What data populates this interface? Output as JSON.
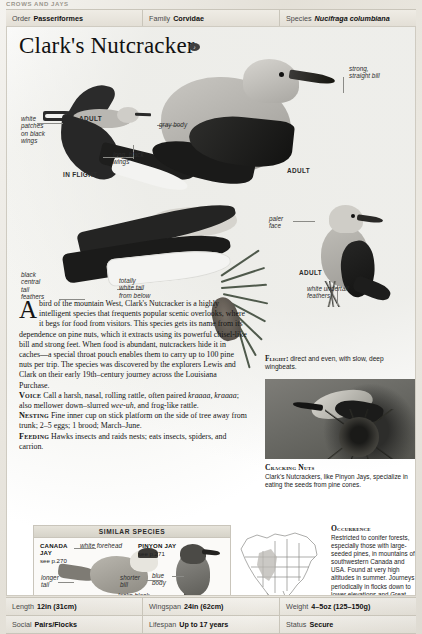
{
  "running_head": "CROWS AND JAYS",
  "taxonomy": [
    {
      "key": "Order",
      "value": "Passeriformes",
      "italic": false
    },
    {
      "key": "Family",
      "value": "Corvidae",
      "italic": false
    },
    {
      "key": "Species",
      "value": "Nucifraga columbiana",
      "italic": true
    }
  ],
  "title": "Clark's Nutcracker",
  "title_badge": "♪",
  "labels": {
    "white_patches": "white\npatches\non black\nwings",
    "in_flight": "IN FLIGHT",
    "adult_flight": "ADULT",
    "long_black_wings": "long, black\nwings",
    "gray_body": "gray body",
    "strong_straight_bill": "strong,\nstraight bill",
    "adult_main": "ADULT",
    "paler_face": "paler\nface",
    "adult_right": "ADULT",
    "white_undertail": "white undertail\nfeathers",
    "black_central_tail": "black\ncentral\ntail\nfeathers",
    "totally_white_tail": "totally\nwhite tail\nfrom below"
  },
  "body": {
    "dropcap": "A",
    "intro": " bird of the mountain West, Clark's Nutcracker is a highly intelligent species that frequents popular scenic overlooks, where it begs for food from visitors. This species gets its name from its dependence on pine nuts, which it extracts using its powerful chisel-like bill and strong feet. When food is abundant, nutcrackers hide it in caches—a special throat pouch enables them to carry up to 100 pine nuts per trip. The species was discovered by the explorers Lewis and Clark on their early 19th–century journey across the Louisiana Purchase.",
    "voice_label": "Voice",
    "voice_text_1": " Call a harsh, nasal, rolling rattle, often paired ",
    "voice_call_1": "kraaaa, kraaaa",
    "voice_text_2": "; also mellower down–slurred ",
    "voice_call_2": "wee-uh",
    "voice_text_3": ", and frog-like rattle.",
    "nesting_label": "Nesting",
    "nesting_text": " Fine inner cup on stick platform on the side of tree away from trunk; 2–5 eggs; 1 brood; March–June.",
    "feeding_label": "Feeding",
    "feeding_text": " Hawks insects and raids nests; eats insects, spiders, and carrion."
  },
  "flight_note": {
    "label": "Flight:",
    "text": " direct and even, with slow, deep wingbeats."
  },
  "photo_caption": {
    "title": "Cracking Nuts",
    "text": "Clark's Nutcrackers, like Pinyon Jays, specialize in eating the seeds from pine cones."
  },
  "similar_species": {
    "heading": "SIMILAR SPECIES",
    "canada_jay": {
      "name": "CANADA\nJAY",
      "ref": "see p.270",
      "label_forehead": "white forehead",
      "label_tail": "longer\ntail"
    },
    "pinyon_jay": {
      "name": "PINYON JAY",
      "ref": "see p.271",
      "label_bill": "shorter\nbill",
      "label_body": "blue\nbody",
      "label_tail": "lacks black-\nand-white\non tail"
    }
  },
  "occurrence": {
    "title": "Occurrence",
    "text": "Restricted to conifer forests, especially those with large-seeded pines, in mountains of southwestern Canada and USA. Found at very high altitudes in summer. Journeys periodically in flocks down to lower elevations and Great Plains when cone crops fail, otherwise resident."
  },
  "stats": [
    [
      {
        "key": "Length",
        "value": "12in (31cm)"
      },
      {
        "key": "Wingspan",
        "value": "24in (62cm)"
      },
      {
        "key": "Weight",
        "value": "4–5oz (125–150g)"
      }
    ],
    [
      {
        "key": "Social",
        "value": "Pairs/Flocks"
      },
      {
        "key": "Lifespan",
        "value": "Up to 17 years"
      },
      {
        "key": "Status",
        "value": "Secure"
      }
    ]
  ],
  "colors": {
    "page_bg": "#e7e4dc",
    "plate_bg": "#ffffff",
    "rule": "#c9c5ba",
    "range_map": "#8a8a86"
  }
}
